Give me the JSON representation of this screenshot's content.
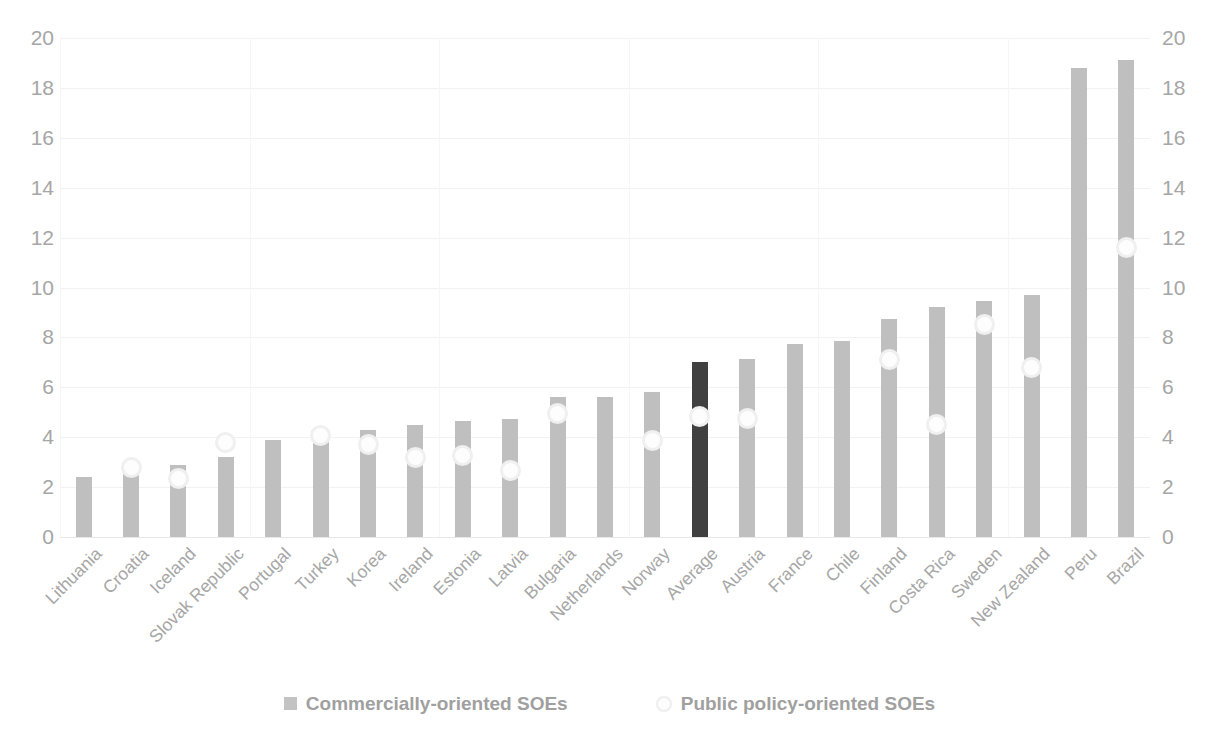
{
  "chart_data": {
    "type": "bar",
    "title": "",
    "subtitle": "",
    "xlabel": "",
    "ylabel": "",
    "ylim": [
      0,
      20
    ],
    "y_ticks": [
      0,
      2,
      4,
      6,
      8,
      10,
      12,
      14,
      16,
      18,
      20
    ],
    "secondary_y_axis": true,
    "secondary_y_ticks": [
      0,
      2,
      4,
      6,
      8,
      10,
      12,
      14,
      16,
      18,
      20
    ],
    "grid": true,
    "legend_position": "bottom",
    "categories": [
      "Lithuania",
      "Croatia",
      "Iceland",
      "Slovak Republic",
      "Portugal",
      "Turkey",
      "Korea",
      "Ireland",
      "Estonia",
      "Latvia",
      "Bulgaria",
      "Netherlands",
      "Norway",
      "Average",
      "Austria",
      "France",
      "Chile",
      "Finland",
      "Costa Rica",
      "Sweden",
      "New Zealand",
      "Peru",
      "Brazil"
    ],
    "series": [
      {
        "name": "Commercially-oriented SOEs",
        "type": "bar",
        "color": "#bfbfbf",
        "highlight_color": "#404040",
        "highlight_category": "Average",
        "values": [
          2.4,
          2.7,
          2.9,
          3.2,
          3.9,
          4.0,
          4.3,
          4.5,
          4.65,
          4.75,
          5.6,
          5.6,
          5.8,
          7.0,
          7.15,
          7.75,
          7.85,
          8.75,
          9.2,
          9.45,
          9.7,
          18.8,
          19.1
        ]
      },
      {
        "name": "Public policy-oriented SOEs",
        "type": "scatter",
        "color": "#fdfdfd",
        "values": [
          null,
          2.8,
          2.35,
          3.8,
          null,
          4.05,
          3.7,
          3.2,
          3.25,
          2.65,
          4.95,
          null,
          3.85,
          4.85,
          4.75,
          null,
          null,
          7.1,
          4.5,
          8.5,
          6.8,
          null,
          11.6
        ]
      }
    ]
  },
  "axes": {
    "left_axis_name": "left-y-axis",
    "right_axis_name": "right-y-axis"
  },
  "legend": {
    "items": [
      {
        "label": "Commercially-oriented SOEs",
        "marker": "square-swatch",
        "color": "#c3c3c3"
      },
      {
        "label": "Public policy-oriented SOEs",
        "marker": "circle-swatch",
        "color": "#fdfdfd"
      }
    ]
  }
}
